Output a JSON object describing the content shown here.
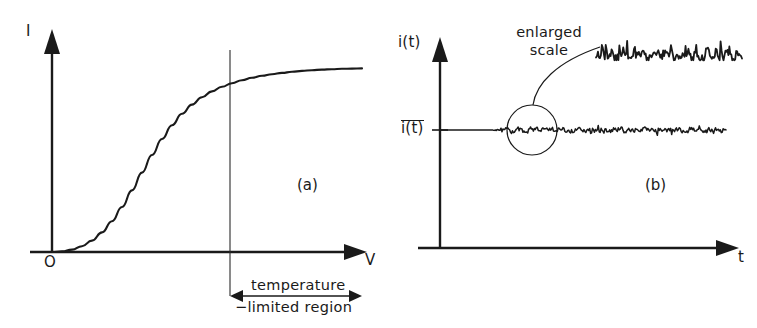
{
  "figure": {
    "background": "#ffffff",
    "ink": "#1a1a1a"
  },
  "panel_a": {
    "id": "(a)",
    "y_axis_label": "I",
    "x_axis_label": "V",
    "origin_label": "O",
    "region_label_line1": "temperature",
    "region_label_line2": "−limited region",
    "axes": {
      "origin_px": [
        52,
        252
      ],
      "x_end_px": [
        366,
        252
      ],
      "y_top_px": [
        52,
        30
      ],
      "divider_x_px": 230,
      "divider_top_px": 50,
      "divider_bottom_px": 296
    },
    "curve_note": "saturating S-shaped I-V characteristic",
    "curve_points": [
      [
        52,
        252
      ],
      [
        62,
        251.4
      ],
      [
        72,
        249.6
      ],
      [
        82,
        246.2
      ],
      [
        92,
        240.6
      ],
      [
        102,
        232.4
      ],
      [
        112,
        221.2
      ],
      [
        122,
        207.0
      ],
      [
        132,
        190.4
      ],
      [
        142,
        172.6
      ],
      [
        152,
        155.0
      ],
      [
        162,
        139.0
      ],
      [
        172,
        125.2
      ],
      [
        182,
        113.8
      ],
      [
        192,
        104.6
      ],
      [
        202,
        97.2
      ],
      [
        212,
        91.4
      ],
      [
        222,
        86.8
      ],
      [
        232,
        83.2
      ],
      [
        242,
        80.2
      ],
      [
        252,
        77.8
      ],
      [
        262,
        75.8
      ],
      [
        272,
        74.2
      ],
      [
        282,
        72.9
      ],
      [
        292,
        71.8
      ],
      [
        302,
        70.9
      ],
      [
        312,
        70.2
      ],
      [
        322,
        69.6
      ],
      [
        332,
        69.2
      ],
      [
        342,
        68.8
      ],
      [
        352,
        68.6
      ],
      [
        362,
        68.4
      ]
    ],
    "region_arrow": {
      "y_px": 296,
      "x_start_px": 230,
      "x_end_px": 362
    }
  },
  "panel_b": {
    "id": "(b)",
    "y_axis_label": "i(t)",
    "x_axis_label": "t",
    "mean_label": "i(t)",
    "mean_label_has_overline": true,
    "callout_line1": "enlarged",
    "callout_line2": "scale",
    "axes": {
      "origin_px": [
        440,
        248
      ],
      "x_end_px": [
        740,
        248
      ],
      "y_top_px": [
        440,
        38
      ],
      "mean_level_px": 130
    },
    "trace": {
      "flat_until_px": 490,
      "start_px": 440,
      "end_px": 726,
      "amplitude_px": 4.2,
      "seed": 1337,
      "samples": 300
    },
    "magnifier_circle": {
      "center_px": [
        532,
        130
      ],
      "radius_px": 25
    },
    "leader_line": {
      "from_px": [
        533,
        105
      ],
      "to_px": [
        600,
        48
      ],
      "curved": true
    },
    "enlarged_trace": {
      "x_start_px": 596,
      "x_end_px": 742,
      "baseline_px": 56,
      "amplitude_px": 22,
      "seed": 20771,
      "samples": 150
    }
  }
}
